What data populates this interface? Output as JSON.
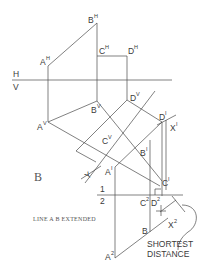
{
  "diagram": {
    "type": "descriptive-geometry-auxiliary-views",
    "fold_lines": {
      "hv": {
        "upper": "H",
        "lower": "V"
      },
      "one_two": {
        "upper": "1",
        "lower": "2"
      }
    },
    "points": {
      "AH": {
        "base": "A",
        "sup": "H"
      },
      "BH": {
        "base": "B",
        "sup": "H"
      },
      "CH": {
        "base": "C",
        "sup": "H"
      },
      "DH": {
        "base": "D",
        "sup": "H"
      },
      "AV": {
        "base": "A",
        "sup": "V"
      },
      "BV": {
        "base": "B",
        "sup": "V"
      },
      "CV": {
        "base": "C",
        "sup": "V"
      },
      "DV": {
        "base": "D",
        "sup": "V"
      },
      "A1": {
        "base": "A",
        "sup": "I"
      },
      "B1": {
        "base": "B",
        "sup": "I"
      },
      "C1": {
        "base": "C",
        "sup": "I"
      },
      "D1": {
        "base": "D",
        "sup": "I"
      },
      "X1": {
        "base": "X",
        "sup": "I"
      },
      "C2": {
        "base": "C",
        "sup": "2"
      },
      "D2": {
        "base": "D",
        "sup": "2"
      },
      "A2": {
        "base": "A",
        "sup": "2"
      },
      "B2": {
        "base": "B",
        "sup": ""
      },
      "X2": {
        "base": "X",
        "sup": "2"
      }
    },
    "view_label": "B",
    "y_marker": "Y",
    "annotations": {
      "line_ab_extended": "LINE A B EXTENDED",
      "shortest_line1": "SHORTEST",
      "shortest_line2": "DISTANCE"
    }
  }
}
